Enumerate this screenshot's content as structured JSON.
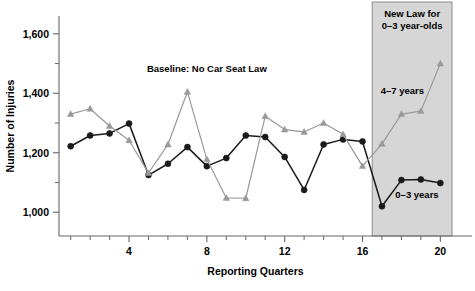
{
  "chart_data": {
    "type": "line",
    "title": "",
    "xlabel": "Reporting Quarters",
    "ylabel": "Number of Injuries",
    "x": [
      1,
      2,
      3,
      4,
      5,
      6,
      7,
      8,
      9,
      10,
      11,
      12,
      13,
      14,
      15,
      16,
      17,
      18,
      19,
      20
    ],
    "xlim": [
      0.4,
      20.6
    ],
    "ylim": [
      920,
      1660
    ],
    "xticks_major": [
      4,
      8,
      12,
      16,
      20
    ],
    "xticks_major_labels": [
      "4",
      "8",
      "12",
      "16",
      "20"
    ],
    "xticks_minor": [
      1,
      2,
      3,
      5,
      6,
      7,
      9,
      10,
      11,
      13,
      14,
      15,
      17,
      18,
      19
    ],
    "yticks_major": [
      1000,
      1200,
      1400,
      1600
    ],
    "yticks_major_labels": [
      "1,000",
      "1,200",
      "1,400",
      "1,600"
    ],
    "yticks_minor": [
      1100,
      1300,
      1500
    ],
    "grid": false,
    "legend_position": "inline-annotation",
    "series": [
      {
        "name": "0-3 years",
        "label": "0–3 years",
        "color": "#1a1a1a",
        "marker": "circle",
        "values": [
          1222,
          1258,
          1265,
          1298,
          1125,
          1163,
          1219,
          1155,
          1182,
          1258,
          1253,
          1186,
          1075,
          1228,
          1245,
          1238,
          1020,
          1108,
          1110,
          1098
        ]
      },
      {
        "name": "4-7 years",
        "label": "4–7 years",
        "color": "#999999",
        "marker": "triangle",
        "values": [
          1330,
          1348,
          1290,
          1242,
          1132,
          1228,
          1405,
          1178,
          1048,
          1047,
          1323,
          1278,
          1270,
          1300,
          1262,
          1155,
          1230,
          1330,
          1340,
          1500
        ]
      }
    ],
    "annotations": [
      {
        "name": "baseline-note",
        "text": "Baseline: No Car Seat Law",
        "x_data": 8.0,
        "y_data": 1473
      }
    ],
    "shaded_region": {
      "name": "new-law-period",
      "x_start": 16.5,
      "x_end": 20.6,
      "fill": "#d6d6d6",
      "border": "#8c8c8c",
      "label_line1": "New Law for",
      "label_line2": "0–3 year-olds"
    },
    "series_label_positions": [
      {
        "series": "4-7 years",
        "x_data": 18.05,
        "y_data": 1398
      },
      {
        "series": "0-3 years",
        "x_data": 18.8,
        "y_data": 1048
      }
    ],
    "axis_color": "#666666",
    "plot": {
      "left": 59,
      "right": 452,
      "top": 16,
      "bottom": 236
    }
  }
}
